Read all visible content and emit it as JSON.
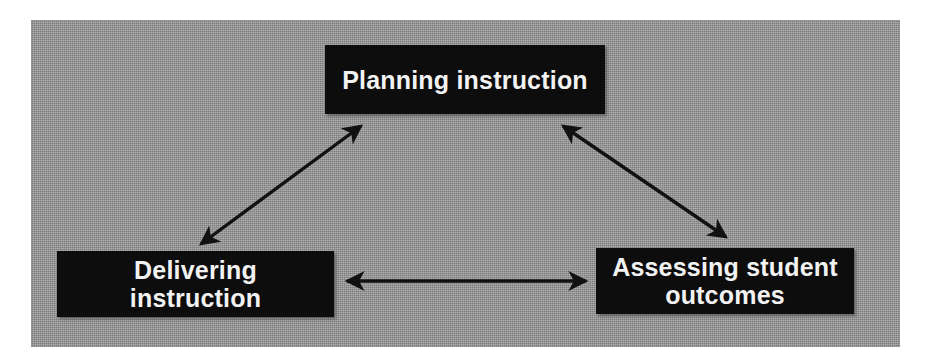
{
  "diagram": {
    "panel": {
      "background_color": "#9b9b9b",
      "border_color": "#8f8f8f"
    },
    "node_style": {
      "fill_color": "#0d0d0d",
      "text_color": "#f2f2f2"
    },
    "arrow_color": "#111111",
    "nodes": [
      {
        "id": "planning",
        "label": "Planning instruction"
      },
      {
        "id": "delivering",
        "label": "Delivering instruction"
      },
      {
        "id": "assessing",
        "label": "Assessing student\noutcomes"
      }
    ],
    "connectors": [
      {
        "id": "delivering-planning",
        "from": "delivering",
        "to": "planning",
        "style": "double-headed-arrow"
      },
      {
        "id": "planning-assessing",
        "from": "planning",
        "to": "assessing",
        "style": "double-headed-arrow"
      },
      {
        "id": "delivering-assessing",
        "from": "delivering",
        "to": "assessing",
        "style": "double-headed-arrow"
      }
    ]
  }
}
